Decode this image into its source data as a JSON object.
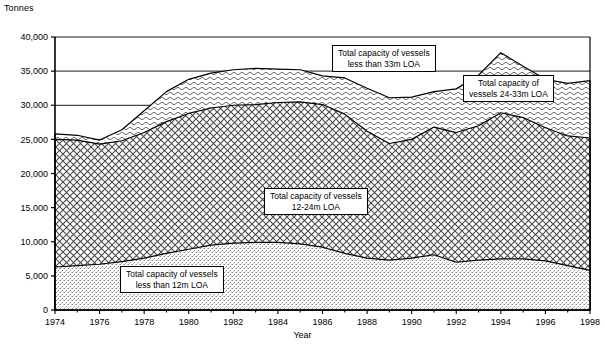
{
  "chart_data": {
    "type": "area",
    "stacked": true,
    "title": "",
    "ylabel": "Tonnes",
    "xlabel": "Year",
    "grid": "horizontal-gridlines-only",
    "legend": "in-plot callout boxes",
    "ylim": [
      0,
      40000
    ],
    "ytick_step": 5000,
    "ytick_labels": [
      "0",
      "5,000",
      "10,000",
      "15,000",
      "20,000",
      "25,000",
      "30,000",
      "35,000",
      "40,000"
    ],
    "ytick_values": [
      0,
      5000,
      10000,
      15000,
      20000,
      25000,
      30000,
      35000,
      40000
    ],
    "xlim": [
      1974,
      1998
    ],
    "xtick_labels": [
      "1974",
      "1976",
      "1978",
      "1980",
      "1982",
      "1984",
      "1986",
      "1988",
      "1990",
      "1992",
      "1994",
      "1996",
      "1998"
    ],
    "xtick_values": [
      1974,
      1976,
      1978,
      1980,
      1982,
      1984,
      1986,
      1988,
      1990,
      1992,
      1994,
      1996,
      1998
    ],
    "x": [
      1974,
      1975,
      1976,
      1977,
      1978,
      1979,
      1980,
      1981,
      1982,
      1983,
      1984,
      1985,
      1986,
      1987,
      1988,
      1989,
      1990,
      1991,
      1992,
      1993,
      1994,
      1995,
      1996,
      1997,
      1998
    ],
    "series": [
      {
        "name": "Total capacity of vessels less than 12m LOA",
        "fill": "fine-stipple",
        "values": [
          6300,
          6500,
          6700,
          7100,
          7600,
          8300,
          8900,
          9500,
          9800,
          9900,
          9900,
          9700,
          9200,
          8300,
          7600,
          7300,
          7600,
          8100,
          7000,
          7300,
          7500,
          7500,
          7200,
          6500,
          5800
        ]
      },
      {
        "name": "Total capacity of vessels 12-24m LOA",
        "fill": "cross-hatch-diamond",
        "values": [
          18700,
          18400,
          17600,
          17700,
          18400,
          19300,
          19900,
          20100,
          20200,
          20200,
          20500,
          20800,
          20900,
          20400,
          18600,
          17100,
          17400,
          18700,
          19000,
          19700,
          21400,
          20700,
          19500,
          19000,
          19400
        ]
      },
      {
        "name": "Total capacity of vessels 24-33m LOA",
        "fill": "wave-hatch",
        "values": [
          800,
          700,
          600,
          1600,
          3200,
          4400,
          5000,
          5100,
          5200,
          5300,
          4900,
          4700,
          4200,
          5300,
          6300,
          6700,
          6200,
          5200,
          6400,
          7400,
          8800,
          7500,
          7100,
          7700,
          8400
        ]
      }
    ],
    "totals": [
      25800,
      25600,
      24900,
      26400,
      29200,
      32000,
      33800,
      34700,
      35200,
      35400,
      35300,
      35200,
      34300,
      34000,
      32500,
      31100,
      31200,
      32000,
      32400,
      34400,
      37700,
      35700,
      33800,
      33200,
      33600
    ]
  },
  "labels": {
    "y_axis_title": "Tonnes",
    "x_axis_title": "Year",
    "callout_33m": "Total capacity of vessels\nless than 33m LOA",
    "callout_24_33m": "Total capacity of\nvessels 24-33m LOA",
    "callout_12_24m": "Total capacity of vessels\n12-24m LOA",
    "callout_12m": "Total capacity of vessels\nless than 12m  LOA"
  },
  "colors": {
    "axis": "#000000",
    "gridline": "#000000",
    "plot_background": "#ffffff",
    "series_line": "#000000"
  }
}
